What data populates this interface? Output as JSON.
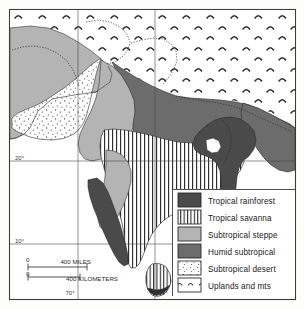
{
  "figure": {
    "kind": "map",
    "background_color": "#fdfdfc",
    "frame_color": "#3c3c3c"
  },
  "legend": {
    "name": "map-legend",
    "border_color": "#3c3c3c",
    "items": [
      {
        "key": "tropical-rainforest",
        "label": "Tropical rainforest",
        "pattern": "solid-dark",
        "color": "#4a4a4a"
      },
      {
        "key": "tropical-savanna",
        "label": "Tropical savanna",
        "pattern": "vertical-lines",
        "color": "#ffffff"
      },
      {
        "key": "subtropical-steppe",
        "label": "Subtropical steppe",
        "pattern": "solid-light",
        "color": "#b4b4b4"
      },
      {
        "key": "humid-subtropical",
        "label": "Humid subtropical",
        "pattern": "solid-medium",
        "color": "#6c6c6c"
      },
      {
        "key": "subtropical-desert",
        "label": "Subtropical desert",
        "pattern": "stipple-dots",
        "color": "#ffffff"
      },
      {
        "key": "uplands-and-mts",
        "label": "Uplands and mts",
        "pattern": "carets",
        "color": "#ffffff"
      }
    ]
  },
  "graticule": {
    "name": "graticule-labels",
    "latitudes": [
      {
        "label": "20°",
        "value": 20
      },
      {
        "label": "10°",
        "value": 10
      }
    ],
    "longitudes": [
      {
        "label": "70°",
        "value": 70
      },
      {
        "label": "80°",
        "value": 80
      }
    ]
  },
  "scalebar": {
    "name": "scale-bar",
    "miles": {
      "zero": "0",
      "label": "400 MILES",
      "value": 400
    },
    "kilometers": {
      "zero": "0",
      "label": "400 KILOMETERS",
      "value": 400
    }
  }
}
